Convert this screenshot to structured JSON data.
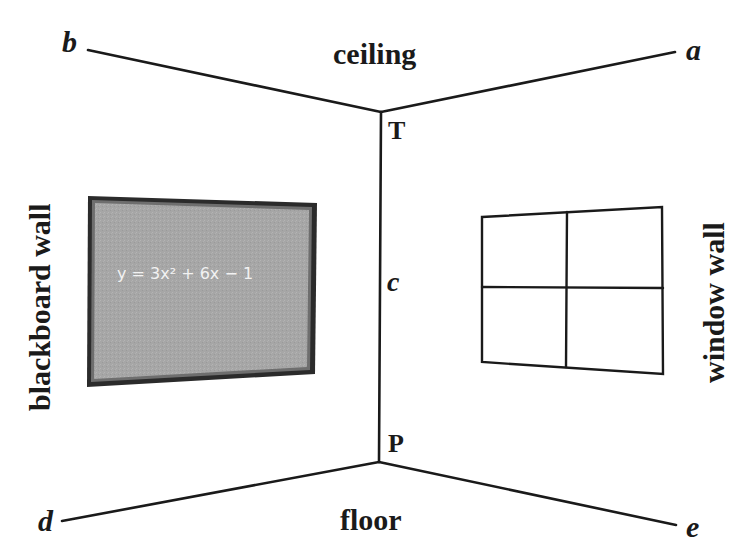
{
  "diagram": {
    "region_labels": {
      "ceiling": "ceiling",
      "floor": "floor",
      "blackboard_wall": "blackboard wall",
      "window_wall": "window wall"
    },
    "point_labels": {
      "a": "a",
      "b": "b",
      "c": "c",
      "d": "d",
      "e": "e",
      "T": "T",
      "P": "P"
    },
    "blackboard": {
      "equation": "y = 3x² + 6x − 1",
      "fill_color": "#a9a9a9",
      "frame_color": "#2b2b2b"
    },
    "window": {
      "panes": 4,
      "frame_color": "#1a1a1a"
    },
    "colors": {
      "background": "#ffffff",
      "line": "#1a1a1a"
    }
  }
}
